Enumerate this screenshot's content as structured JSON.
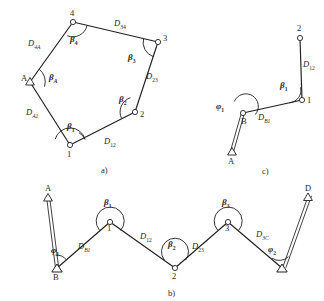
{
  "figure": {
    "background_color": "#ffffff",
    "line_color": "#1f1f1f",
    "panels": [
      {
        "id": "a",
        "caption": "a)",
        "type": "closed-polygon-traverse",
        "station_labels": [
          "A",
          "4",
          "3",
          "2",
          "1"
        ],
        "distance_labels": [
          "D4A",
          "D34",
          "D23",
          "D12",
          "DA1"
        ],
        "angle_labels": [
          "βA",
          "β4",
          "β3",
          "β2",
          "β1"
        ]
      },
      {
        "id": "b",
        "caption": "b)",
        "type": "connecting-traverse",
        "station_labels": [
          "A",
          "B",
          "1",
          "2",
          "3",
          "C",
          "D"
        ],
        "distance_labels": [
          "DB1",
          "D12",
          "D23",
          "D3C"
        ],
        "angle_labels": [
          "φ1",
          "β1",
          "β2",
          "β3",
          "φ2"
        ]
      },
      {
        "id": "c",
        "caption": "c)",
        "type": "open-hanging-traverse",
        "station_labels": [
          "A",
          "B",
          "1",
          "2"
        ],
        "distance_labels": [
          "DB1",
          "D12"
        ],
        "angle_labels": [
          "φ1",
          "β1"
        ]
      }
    ]
  },
  "labels": {
    "panel_a": {
      "caption": "a)",
      "pt_A": "A",
      "pt_4": "4",
      "pt_3": "3",
      "pt_2": "2",
      "pt_1": "1",
      "d_4A_base": "D",
      "d_4A_sub": "4A",
      "d_34_base": "D",
      "d_34_sub": "34",
      "d_23_base": "D",
      "d_23_sub": "23",
      "d_12_base": "D",
      "d_12_sub": "12",
      "d_A1_base": "D",
      "d_A1_sub": "A1",
      "b_A_base": "β",
      "b_A_sub": "A",
      "b_4_base": "β",
      "b_4_sub": "4",
      "b_3_base": "β",
      "b_3_sub": "3",
      "b_2_base": "β",
      "b_2_sub": "2",
      "b_1_base": "β",
      "b_1_sub": "1"
    },
    "panel_b": {
      "caption": "b)",
      "pt_A": "A",
      "pt_B": "B",
      "pt_1": "1",
      "pt_2": "2",
      "pt_3": "3",
      "pt_D": "D",
      "d_B1_base": "D",
      "d_B1_sub": "B1",
      "d_12_base": "D",
      "d_12_sub": "12",
      "d_23_base": "D",
      "d_23_sub": "23",
      "d_3C_base": "D",
      "d_3C_sub": "3C",
      "f_1_base": "φ",
      "f_1_sub": "1",
      "b_1_base": "β",
      "b_1_sub": "1",
      "b_2_base": "β",
      "b_2_sub": "2",
      "b_3_base": "β",
      "b_3_sub": "3",
      "f_2_base": "φ",
      "f_2_sub": "2"
    },
    "panel_c": {
      "caption": "c)",
      "pt_A": "A",
      "pt_B": "B",
      "pt_1": "1",
      "pt_2": "2",
      "d_B1_base": "D",
      "d_B1_sub": "B1",
      "d_12_base": "D",
      "d_12_sub": "12",
      "f_1_base": "φ",
      "f_1_sub": "1",
      "b_1_base": "β",
      "b_1_sub": "1"
    }
  }
}
